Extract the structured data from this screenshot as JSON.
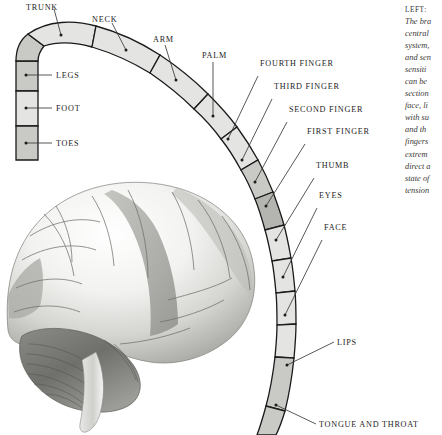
{
  "figure": {
    "colors": {
      "band_light": "#e4e4e2",
      "band_mid": "#c9c9c6",
      "band_dark": "#b4b4b0",
      "outline": "#1a1a1a",
      "leader_line": "#3a3a38",
      "label_text": "#1c1c1c",
      "background": "#ffffff"
    },
    "band_segments": [
      {
        "name": "toes",
        "label": "TOES",
        "shade": "band_mid"
      },
      {
        "name": "foot",
        "label": "FOOT",
        "shade": "band_light"
      },
      {
        "name": "legs",
        "label": "LEGS",
        "shade": "band_mid"
      },
      {
        "name": "trunk",
        "label": "TRUNK",
        "shade": "band_light"
      },
      {
        "name": "neck",
        "label": "NECK",
        "shade": "band_light"
      },
      {
        "name": "arm",
        "label": "ARM",
        "shade": "band_light"
      },
      {
        "name": "palm",
        "label": "PALM",
        "shade": "band_light"
      },
      {
        "name": "fourth-finger",
        "label": "FOURTH FINGER",
        "shade": "band_light"
      },
      {
        "name": "third-finger",
        "label": "THIRD FINGER",
        "shade": "band_mid"
      },
      {
        "name": "second-finger",
        "label": "SECOND FINGER",
        "shade": "band_dark"
      },
      {
        "name": "first-finger",
        "label": "FIRST FINGER",
        "shade": "band_light"
      },
      {
        "name": "thumb",
        "label": "THUMB",
        "shade": "band_light"
      },
      {
        "name": "eyes",
        "label": "EYES",
        "shade": "band_light"
      },
      {
        "name": "face",
        "label": "FACE",
        "shade": "band_light"
      },
      {
        "name": "lips",
        "label": "LIPS",
        "shade": "band_mid"
      },
      {
        "name": "tongue-throat",
        "label": "TONGUE AND THROAT",
        "shade": "band_mid"
      }
    ]
  },
  "caption": {
    "lead": "LEFT:",
    "lines": [
      "The bra",
      "central",
      "system,",
      "and sen",
      "sensiti",
      "can be",
      "section",
      "face, li",
      "with su",
      "and th",
      "fingers",
      "extrem",
      "direct a",
      "state of",
      "tension"
    ]
  }
}
